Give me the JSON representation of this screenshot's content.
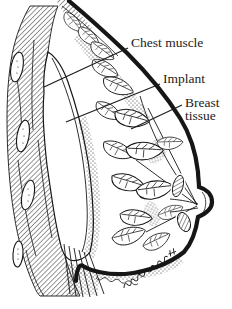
{
  "figure": {
    "background": "#ffffff",
    "ink": "#161616",
    "labels": {
      "chest_muscle": "Chest muscle",
      "implant": "Implant",
      "breast_tissue_line1": "Breast",
      "breast_tissue_line2": "tissue"
    }
  }
}
